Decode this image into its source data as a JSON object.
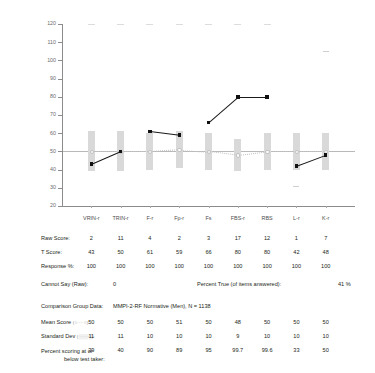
{
  "chart_data": {
    "type": "line",
    "title": "",
    "xlabel": "",
    "ylabel": "",
    "ylim": [
      20,
      120
    ],
    "yticks": [
      120,
      110,
      100,
      90,
      80,
      70,
      60,
      50,
      40,
      30,
      20
    ],
    "grid": false,
    "reference_line": 50,
    "legend_position": "none",
    "categories": [
      "VRIN-r",
      "TRIN-r",
      "F-r",
      "Fp-r",
      "Fs",
      "FBS-r",
      "RBS",
      "L-r",
      "K-r"
    ],
    "series": [
      {
        "name": "T Score",
        "values": [
          43,
          50,
          61,
          59,
          66,
          80,
          80,
          42,
          48
        ],
        "segments": [
          [
            0,
            1
          ],
          [
            2,
            3
          ],
          [
            4,
            5
          ],
          [
            5,
            6
          ],
          [
            7,
            8
          ]
        ],
        "marker": "filled-square",
        "color": "#111111"
      },
      {
        "name": "Mean Score",
        "values": [
          50,
          50,
          50,
          51,
          50,
          48,
          50,
          50,
          50
        ],
        "marker": "dotted-line",
        "color": "#c2c2c2"
      },
      {
        "name": "Standard Dev",
        "values": [
          11,
          11,
          10,
          10,
          10,
          9,
          10,
          10,
          10
        ],
        "marker": "shaded-band",
        "color": "#d9d9d9"
      }
    ],
    "top_ceiling_marks": [
      "VRIN-r",
      "TRIN-r",
      "F-r",
      "Fp-r",
      "Fs",
      "FBS-r",
      "RBS"
    ],
    "kr_high_mark": 105,
    "lr_low_mark": 31
  },
  "table": {
    "row_labels": {
      "raw_score": "Raw Score:",
      "t_score": "T Score:",
      "response_pct": "Response %:",
      "mean_score": "Mean Score",
      "standard_dev": "Standard Dev",
      "percent_scoring_line1": "Percent scoring at or",
      "percent_scoring_line2": "below test taker:"
    },
    "legend_glyphs": {
      "mean_score": "(○····○):",
      "standard_dev": "(░░░░):"
    },
    "rows": {
      "raw_score": [
        "2",
        "11",
        "4",
        "2",
        "3",
        "17",
        "12",
        "1",
        "7"
      ],
      "t_score": [
        "43",
        "50",
        "61",
        "59",
        "66",
        "80",
        "80",
        "42",
        "48"
      ],
      "response_pct": [
        "100",
        "100",
        "100",
        "100",
        "100",
        "100",
        "100",
        "100",
        "100"
      ],
      "mean_score": [
        "50",
        "50",
        "50",
        "51",
        "50",
        "48",
        "50",
        "50",
        "50"
      ],
      "standard_dev": [
        "11",
        "11",
        "10",
        "10",
        "10",
        "9",
        "10",
        "10",
        "10"
      ],
      "percent_scoring": [
        "39",
        "40",
        "90",
        "89",
        "95",
        "99.7",
        "99.6",
        "33",
        "50"
      ]
    }
  },
  "notes": {
    "cannot_say_label": "Cannot Say (Raw):",
    "cannot_say_value": "0",
    "percent_true_label": "Percent True (of items answered):",
    "percent_true_value": "41 %",
    "comparison_label": "Comparison Group Data:",
    "comparison_value": "MMPI-2-RF Normative (Men), N = 1138"
  },
  "colors": {
    "data_line": "#111111",
    "sd_band": "#d9d9d9",
    "mean_line": "#c2c2c2",
    "reference_line": "#b9b9b9",
    "axis": "#8c8c8c"
  }
}
